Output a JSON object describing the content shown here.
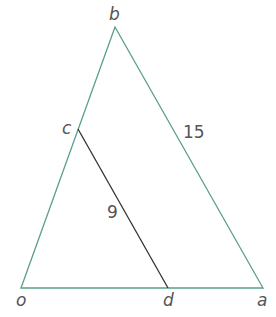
{
  "diagram": {
    "type": "geometry-triangle",
    "colors": {
      "triangle": "#5a9e8c",
      "segment": "#333333",
      "label": "#555555"
    },
    "vertices": {
      "b": {
        "label": "b"
      },
      "c": {
        "label": "c"
      },
      "o": {
        "label": "o"
      },
      "d": {
        "label": "d"
      },
      "a": {
        "label": "a"
      }
    },
    "lengths": {
      "ab": "15",
      "cd": "9"
    }
  }
}
